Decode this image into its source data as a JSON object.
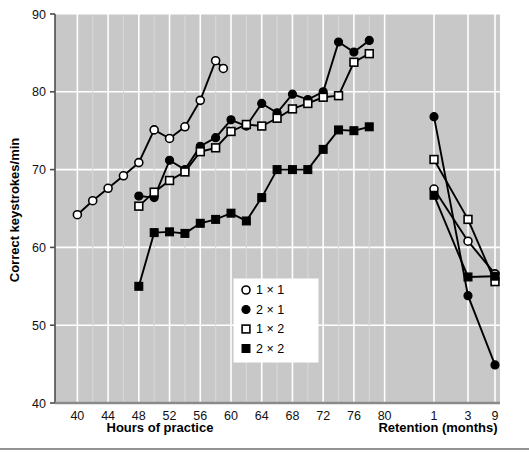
{
  "chart_data": {
    "type": "line",
    "title": "",
    "subtitle": "",
    "xlabel": "Hours of practice",
    "xlabel_secondary": "Retention (months)",
    "ylabel": "Correct keystrokes/min",
    "ylim": [
      40,
      90
    ],
    "yticks": [
      40,
      50,
      60,
      70,
      80,
      90
    ],
    "xticks_practice": [
      40,
      44,
      48,
      52,
      56,
      60,
      64,
      68,
      72,
      76,
      80
    ],
    "xticks_retention": [
      1,
      3,
      9
    ],
    "grid": true,
    "grid_color": "#ffffff",
    "plot_background": "#c8c8c8",
    "legend_position": "center-bottom",
    "series": [
      {
        "name": "1 × 1",
        "marker": "open-circle",
        "color": "#000000",
        "practice_x": [
          40,
          42,
          44,
          46,
          48,
          50,
          52,
          54,
          56,
          58
        ],
        "practice_y": [
          64.2,
          66.0,
          67.6,
          69.2,
          70.9,
          75.1,
          74.0,
          75.5,
          78.9,
          84.0
        ],
        "practice_x_extra": [
          59
        ],
        "practice_y_extra": [
          83.0
        ],
        "retention_x": [
          1,
          3,
          9
        ],
        "retention_y": [
          67.5,
          60.8,
          56.6
        ]
      },
      {
        "name": "2 × 1",
        "marker": "filled-circle",
        "color": "#000000",
        "practice_x": [
          48,
          50,
          52,
          54,
          56,
          58,
          60,
          62,
          64,
          66,
          68,
          70,
          72,
          74,
          76,
          78
        ],
        "practice_y": [
          66.6,
          66.4,
          71.2,
          70.0,
          73.0,
          74.1,
          76.4,
          75.6,
          78.5,
          77.3,
          79.7,
          79.0,
          80.0,
          86.4,
          85.1,
          86.6
        ],
        "retention_x": [
          1,
          3,
          9
        ],
        "retention_y": [
          76.8,
          53.8,
          44.9
        ]
      },
      {
        "name": "1 × 2",
        "marker": "open-square",
        "color": "#000000",
        "practice_x": [
          48,
          50,
          52,
          54,
          56,
          58,
          60,
          62,
          64,
          66,
          68,
          70,
          72,
          74,
          76,
          78
        ],
        "practice_y": [
          65.3,
          67.1,
          68.6,
          69.7,
          72.3,
          72.8,
          74.9,
          75.8,
          75.6,
          76.6,
          77.8,
          78.5,
          79.3,
          79.5,
          83.8,
          84.9
        ],
        "retention_x": [
          1,
          3,
          9
        ],
        "retention_y": [
          71.3,
          63.6,
          55.6
        ]
      },
      {
        "name": "2 × 2",
        "marker": "filled-square",
        "color": "#000000",
        "practice_x": [
          48,
          50,
          52,
          54,
          56,
          58,
          60,
          62,
          64,
          66,
          68,
          70,
          72,
          74,
          76,
          78
        ],
        "practice_y": [
          55.0,
          61.9,
          62.0,
          61.8,
          63.1,
          63.6,
          64.4,
          63.4,
          66.4,
          70.0,
          70.0,
          70.0,
          72.6,
          75.1,
          75.0,
          75.5
        ],
        "retention_x": [
          1,
          3,
          9
        ],
        "retention_y": [
          66.7,
          56.2,
          56.3
        ]
      }
    ],
    "legend": [
      {
        "label": "1 × 1",
        "marker": "open-circle"
      },
      {
        "label": "2 × 1",
        "marker": "filled-circle"
      },
      {
        "label": "1 × 2",
        "marker": "open-square"
      },
      {
        "label": "2 × 2",
        "marker": "filled-square"
      }
    ]
  }
}
